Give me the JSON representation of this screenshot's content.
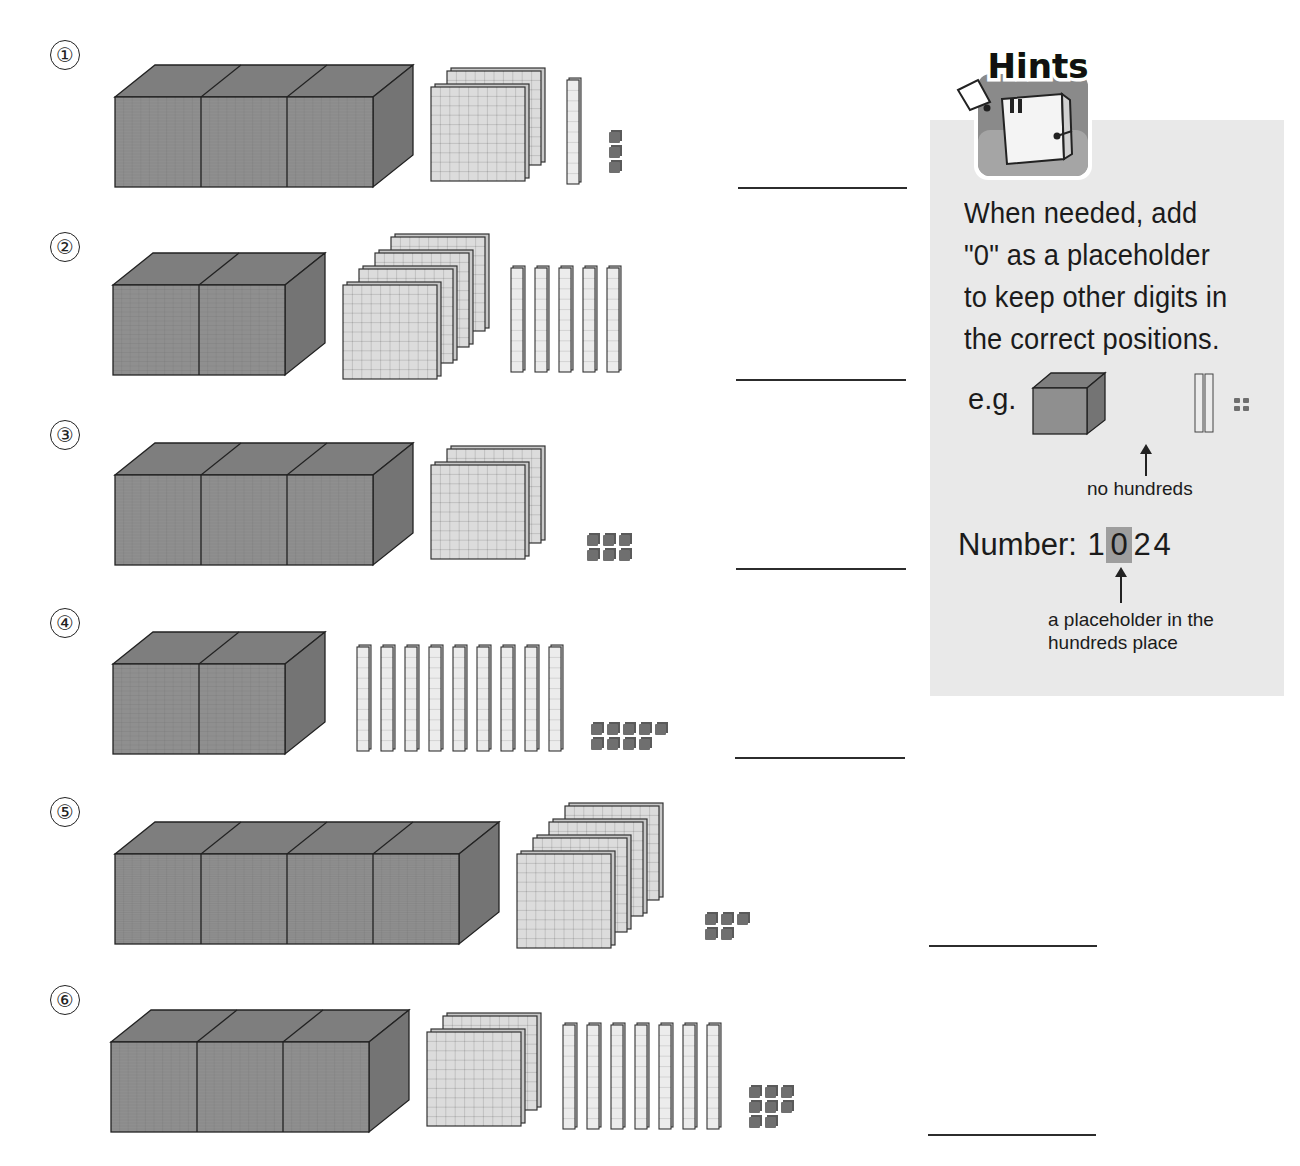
{
  "worksheet": {
    "problems": [
      {
        "label": "①",
        "thousands": 3,
        "hundreds": 2,
        "tens": 1,
        "ones": 3,
        "answer": ""
      },
      {
        "label": "②",
        "thousands": 2,
        "hundreds": 4,
        "tens": 5,
        "ones": 0,
        "answer": ""
      },
      {
        "label": "③",
        "thousands": 3,
        "hundreds": 2,
        "tens": 0,
        "ones": 6,
        "answer": ""
      },
      {
        "label": "④",
        "thousands": 2,
        "hundreds": 0,
        "tens": 9,
        "ones": 9,
        "answer": ""
      },
      {
        "label": "⑤",
        "thousands": 4,
        "hundreds": 4,
        "tens": 0,
        "ones": 5,
        "answer": ""
      },
      {
        "label": "⑥",
        "thousands": 3,
        "hundreds": 2,
        "tens": 7,
        "ones": 8,
        "answer": ""
      }
    ]
  },
  "hints": {
    "badge_title": "Hints",
    "text_lines": [
      "When needed, add",
      "\"0\" as a placeholder",
      "to keep other digits in",
      "the correct positions."
    ],
    "example_label": "e.g.",
    "example_blocks": {
      "thousands": 1,
      "hundreds": 0,
      "tens": 2,
      "ones": 4
    },
    "no_hundreds_caption": "no hundreds",
    "number_label": "Number:",
    "number_digits": [
      "1",
      "0",
      "2",
      "4"
    ],
    "highlight_index": 1,
    "placeholder_caption_line1": "a placeholder in the",
    "placeholder_caption_line2": "hundreds place"
  },
  "colors": {
    "thousand_cube": "#8f8f8f",
    "thousand_top": "#7e7e7e",
    "thousand_side": "#747474",
    "flat_face": "#dcdcdc",
    "rod_face": "#ececec",
    "unit_cube": "#6f6f6f",
    "hint_panel": "#e9e9e9",
    "hint_highlight": "#9e9e9e",
    "badge_green": "#6cc04a"
  }
}
